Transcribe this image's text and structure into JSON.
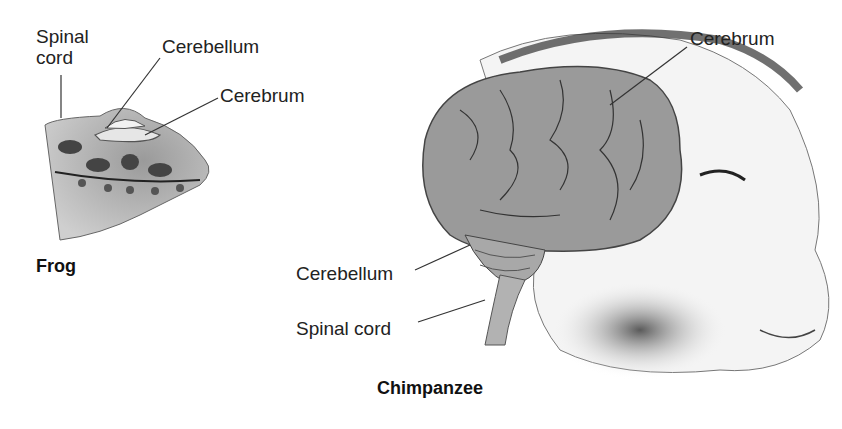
{
  "frog": {
    "title": "Frog",
    "labels": {
      "spinal_cord_line1": "Spinal",
      "spinal_cord_line2": "cord",
      "cerebellum": "Cerebellum",
      "cerebrum": "Cerebrum"
    }
  },
  "chimpanzee": {
    "title": "Chimpanzee",
    "labels": {
      "cerebrum": "Cerebrum",
      "cerebellum": "Cerebellum",
      "spinal_cord": "Spinal cord"
    }
  }
}
